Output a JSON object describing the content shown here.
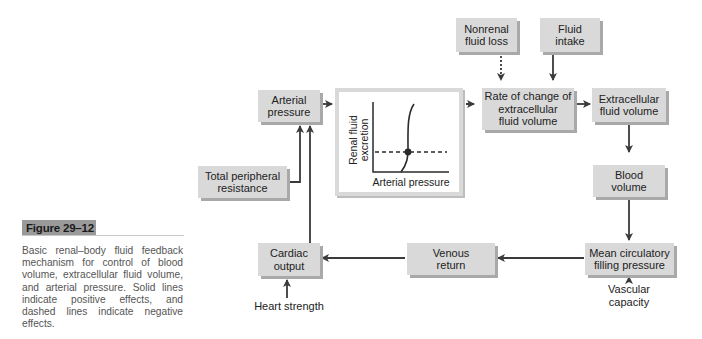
{
  "figure": {
    "title": "Figure 29–12",
    "caption": "Basic renal–body fluid feedback mechanism for control of blood volume, extracellular fluid volume, and arterial pressure. Solid lines indicate positive effects, and dashed lines indicate negative effects."
  },
  "nodes": {
    "arterial_pressure": {
      "line1": "Arterial",
      "line2": "pressure"
    },
    "total_peripheral_resistance": {
      "line1": "Total peripheral",
      "line2": "resistance"
    },
    "nonrenal_fluid_loss": {
      "line1": "Nonrenal",
      "line2": "fluid loss"
    },
    "fluid_intake": {
      "line1": "Fluid",
      "line2": "intake"
    },
    "rate_of_change": {
      "line1": "Rate of change of",
      "line2": "extracellular",
      "line3": "fluid volume"
    },
    "extracellular_fluid_volume": {
      "line1": "Extracellular",
      "line2": "fluid volume"
    },
    "blood_volume": {
      "line1": "Blood",
      "line2": "volume"
    },
    "mean_circulatory_filling_pressure": {
      "line1": "Mean circulatory",
      "line2": "filling pressure"
    },
    "venous_return": {
      "line1": "Venous",
      "line2": "return"
    },
    "cardiac_output": {
      "line1": "Cardiac",
      "line2": "output"
    }
  },
  "inputs": {
    "heart_strength": "Heart strength",
    "vascular_capacity": {
      "line1": "Vascular",
      "line2": "capacity"
    }
  },
  "graph": {
    "ylabel_line1": "Renal fluid",
    "ylabel_line2": "excretion",
    "xlabel": "Arterial pressure"
  },
  "edges": [
    {
      "from": "arterial_pressure",
      "to": "renal_function_graph",
      "style": "solid"
    },
    {
      "from": "renal_function_graph",
      "to": "rate_of_change",
      "style": "dashed"
    },
    {
      "from": "nonrenal_fluid_loss",
      "to": "rate_of_change",
      "style": "dotted"
    },
    {
      "from": "fluid_intake",
      "to": "rate_of_change",
      "style": "solid"
    },
    {
      "from": "rate_of_change",
      "to": "extracellular_fluid_volume",
      "style": "solid"
    },
    {
      "from": "extracellular_fluid_volume",
      "to": "blood_volume",
      "style": "solid"
    },
    {
      "from": "blood_volume",
      "to": "mean_circulatory_filling_pressure",
      "style": "solid"
    },
    {
      "from": "vascular_capacity",
      "to": "mean_circulatory_filling_pressure",
      "style": "solid"
    },
    {
      "from": "mean_circulatory_filling_pressure",
      "to": "venous_return",
      "style": "solid"
    },
    {
      "from": "venous_return",
      "to": "cardiac_output",
      "style": "solid"
    },
    {
      "from": "heart_strength",
      "to": "cardiac_output",
      "style": "solid"
    },
    {
      "from": "cardiac_output",
      "to": "arterial_pressure",
      "style": "solid"
    },
    {
      "from": "total_peripheral_resistance",
      "to": "arterial_pressure",
      "style": "solid"
    }
  ],
  "colors": {
    "box_fill": "#d9d9d9",
    "box_shadow": "#a9a9a9",
    "line": "#3a3a3a",
    "title_bg": "#9a9a9a"
  }
}
